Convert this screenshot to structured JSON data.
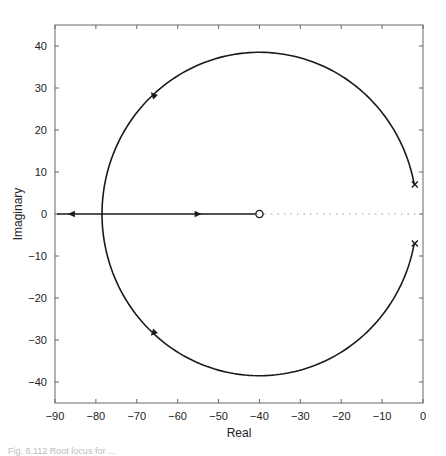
{
  "chart_data": {
    "type": "line",
    "title": "",
    "xlabel": "Real",
    "ylabel": "Imaginary",
    "xlim": [
      -90,
      0
    ],
    "ylim": [
      -45,
      45
    ],
    "xticks": [
      -90,
      -80,
      -70,
      -60,
      -50,
      -40,
      -30,
      -20,
      -10,
      0
    ],
    "yticks": [
      40,
      30,
      20,
      10,
      0,
      -10,
      -20,
      -30,
      -40
    ],
    "xtick_labels": [
      "−90",
      "−80",
      "−70",
      "−60",
      "−50",
      "−40",
      "−30",
      "−20",
      "−10",
      "0"
    ],
    "ytick_labels": [
      "40",
      "30",
      "20",
      "10",
      "0",
      "−10",
      "−20",
      "−30",
      "−40"
    ],
    "grid": false,
    "poles": [
      {
        "re": -2,
        "im": 7
      },
      {
        "re": -2,
        "im": -7
      }
    ],
    "zeros": [
      {
        "re": -40,
        "im": 0
      }
    ],
    "branches": [
      {
        "name": "upper-arc",
        "description": "circle arc from pole (-2,7) over top to breakin (-78.5,0)",
        "center": [
          -40,
          0
        ],
        "radius": 38.5
      },
      {
        "name": "lower-arc",
        "description": "circle arc from pole (-2,-7) under bottom to breakin (-78.5,0)",
        "center": [
          -40,
          0
        ],
        "radius": 38.5
      },
      {
        "name": "real-axis-left",
        "from": [
          -78.5,
          0
        ],
        "to": [
          -90,
          0
        ],
        "arrow_at": -86
      },
      {
        "name": "real-axis-right",
        "from": [
          -78.5,
          0
        ],
        "to": [
          -40,
          0
        ],
        "arrow_at": -55
      }
    ],
    "dotted_segment": {
      "from": [
        -40,
        0
      ],
      "to": [
        0,
        0
      ]
    }
  },
  "caption": "Fig. 6.112 Root locus for ..."
}
